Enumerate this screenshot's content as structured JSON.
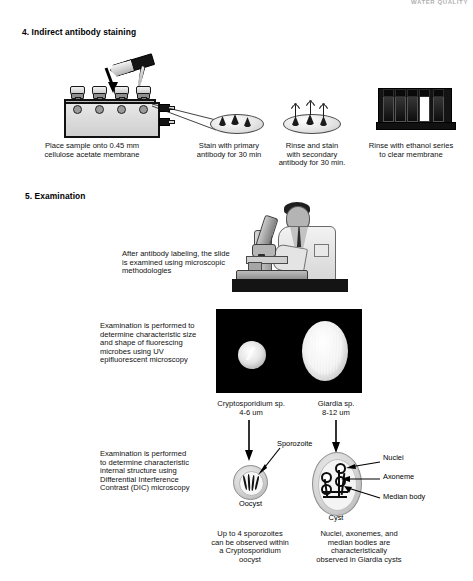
{
  "document": {
    "corner_mark": "WATER QUALITY",
    "sections": [
      {
        "number_label": "4. Indirect antibody staining"
      },
      {
        "number_label": "5. Examination"
      }
    ]
  },
  "staining_steps": [
    {
      "id": "step-filtration",
      "caption": "Place sample onto 0.45 mm\ncellulose acetate membrane",
      "icon": "filtration-manifold-icon"
    },
    {
      "id": "step-primary-antibody",
      "caption": "Stain with primary\nantibody for 30 min",
      "icon": "membrane-dish-icon"
    },
    {
      "id": "step-secondary-antibody",
      "caption": "Rinse and stain\nwith secondary\nantibody for 30 min.",
      "icon": "labeled-membrane-dish-icon"
    },
    {
      "id": "step-ethanol-rinse",
      "caption": "Rinse with ethanol series\nto clear membrane",
      "icon": "slide-rack-icon"
    }
  ],
  "examination": {
    "microscope_caption": "After antibody labeling, the slide\nis examined using  microscopic\nmethodologies",
    "uv_caption": "Examination is performed to\ndetermine characteristic size\nand shape of fluorescing\nmicrobes using UV\nepifluorescent microscopy",
    "dic_caption": "Examination is performed\nto determine characteristic\ninternal structure using\nDifferential Interference\nContrast (DIC) microscopy"
  },
  "organisms": [
    {
      "id": "cryptosporidium",
      "name": "Cryptosporidium sp.",
      "size": "4-6 um",
      "structure_label": "Oocyst",
      "feature_labels": [
        "Sporozoite"
      ],
      "footer_caption": "Up to 4 sporozoites\ncan be observed within\na Cryptosporidium\noocyst"
    },
    {
      "id": "giardia",
      "name": "Giardia sp.",
      "size": "8-12 um",
      "structure_label": "Cyst",
      "feature_labels": [
        "Nuclei",
        "Axoneme",
        "Median body"
      ],
      "footer_caption": "Nuclei, axonemes, and\nmedian bodies are\ncharacteristically\nobserved in Giardia cysts"
    }
  ],
  "colors": {
    "background": "#ffffff",
    "text": "#000000",
    "fluorescence_field": "#000000",
    "dark_equipment": "#141414"
  }
}
